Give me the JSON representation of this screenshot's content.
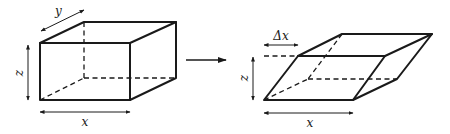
{
  "figure": {
    "left_box": {
      "description": "rectangular box before shear",
      "labels": {
        "width": "x",
        "depth": "y",
        "height": "z"
      }
    },
    "transition_arrow": {
      "direction": "right"
    },
    "right_box": {
      "description": "sheared parallelepiped after shear displacement",
      "labels": {
        "width": "x",
        "height": "z",
        "displacement": "Δx"
      }
    }
  },
  "colors": {
    "line": "#1a1a1a",
    "background": "#ffffff"
  }
}
